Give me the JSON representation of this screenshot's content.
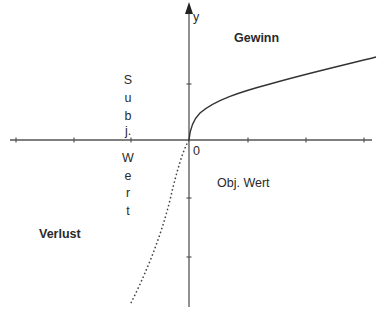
{
  "diagram": {
    "type": "value-function",
    "axes": {
      "y_label": "y",
      "origin_label": "0",
      "x_label": "Obj. Wert",
      "y_axis_title_letters": [
        "S",
        "u",
        "b",
        "j.",
        "W",
        "e",
        "r",
        "t"
      ]
    },
    "regions": {
      "gain": "Gewinn",
      "loss": "Verlust"
    },
    "curves": [
      {
        "name": "gain-curve",
        "style": "solid",
        "shape": "concave (square-root-like)"
      },
      {
        "name": "loss-curve",
        "style": "dotted",
        "shape": "steeper, roughly linear downward"
      }
    ],
    "colors": {
      "axis": "#555555",
      "curve": "#333333",
      "text": "#2a2a2a"
    }
  }
}
